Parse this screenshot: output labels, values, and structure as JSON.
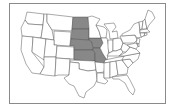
{
  "map": {
    "title": "United States map with highlighted region",
    "highlight_color": "#888888",
    "base_color": "#ffffff",
    "border_color": "#555555",
    "frame_color": "#8a8a8a",
    "highlighted_states": [
      "North Dakota",
      "South Dakota",
      "Nebraska",
      "Kansas",
      "Iowa",
      "Missouri"
    ]
  }
}
